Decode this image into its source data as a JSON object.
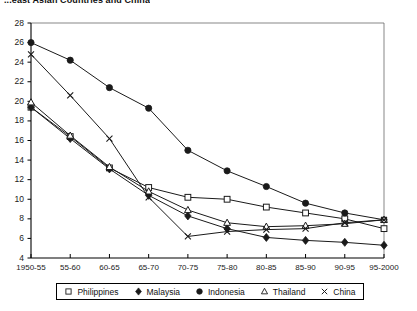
{
  "title": "...east Asian Countries and China",
  "legend": {
    "position": "bottom",
    "items": [
      {
        "label": "Philippines",
        "marker": "open-square-icon"
      },
      {
        "label": "Malaysia",
        "marker": "filled-diamond-icon"
      },
      {
        "label": "Indonesia",
        "marker": "filled-circle-icon"
      },
      {
        "label": "Thailand",
        "marker": "open-triangle-icon"
      },
      {
        "label": "China",
        "marker": "cross-x-icon"
      }
    ]
  },
  "axes": {
    "ylabel": "",
    "xlabel": "",
    "ylim": [
      4,
      28
    ],
    "ystep": 2,
    "yticks": [
      "28",
      "26",
      "24",
      "22",
      "20",
      "18",
      "16",
      "14",
      "12",
      "10",
      "8",
      "6",
      "4"
    ],
    "xticks": [
      "1950-55",
      "55-60",
      "60-65",
      "65-70",
      "70-75",
      "75-80",
      "80-85",
      "85-90",
      "90-95",
      "95-2000"
    ],
    "grid": false
  },
  "chart_data": {
    "type": "line",
    "title": "...east Asian Countries and China",
    "xlabel": "",
    "ylabel": "",
    "ylim": [
      4,
      28
    ],
    "grid": false,
    "legend_position": "bottom",
    "categories": [
      "1950-55",
      "55-60",
      "60-65",
      "65-70",
      "70-75",
      "75-80",
      "80-85",
      "85-90",
      "90-95",
      "95-2000"
    ],
    "series": [
      {
        "name": "Philippines",
        "marker": "open-square",
        "values": [
          19.4,
          16.4,
          13.2,
          11.2,
          10.2,
          10.0,
          9.2,
          8.6,
          8.0,
          7.0
        ]
      },
      {
        "name": "Malaysia",
        "marker": "filled-diamond",
        "values": [
          19.4,
          16.2,
          13.1,
          10.4,
          8.3,
          7.0,
          6.1,
          5.8,
          5.6,
          5.3
        ]
      },
      {
        "name": "Indonesia",
        "marker": "filled-circle",
        "values": [
          26.0,
          24.2,
          21.4,
          19.3,
          15.0,
          12.9,
          11.3,
          9.6,
          8.6,
          7.9
        ]
      },
      {
        "name": "Thailand",
        "marker": "open-triangle",
        "values": [
          19.9,
          16.5,
          13.3,
          10.8,
          8.9,
          7.6,
          7.2,
          7.3,
          7.5,
          7.9
        ]
      },
      {
        "name": "China",
        "marker": "cross-x",
        "values": [
          24.8,
          20.6,
          16.2,
          10.2,
          6.2,
          6.7,
          6.9,
          7.0,
          7.6,
          7.9
        ]
      }
    ]
  },
  "colors": {
    "line": "#1a1a1a",
    "axis": "#000000",
    "background": "#ffffff"
  }
}
